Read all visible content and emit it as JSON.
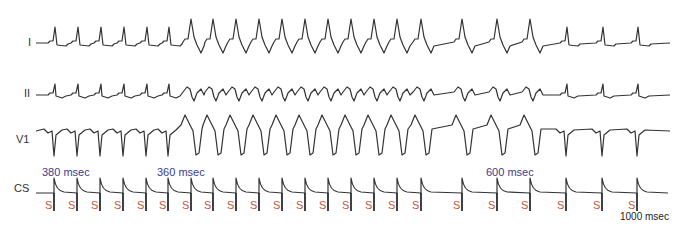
{
  "figure": {
    "leads": [
      {
        "id": "I",
        "label": "I",
        "baseline_y": 43
      },
      {
        "id": "II",
        "label": "II",
        "baseline_y": 95
      },
      {
        "id": "V1",
        "label": "V1",
        "baseline_y": 133
      },
      {
        "id": "CS",
        "label": "CS",
        "baseline_y": 195
      }
    ],
    "interval_labels": [
      {
        "text": "380 msec",
        "x": 42,
        "y": 167
      },
      {
        "text": "360 msec",
        "x": 158,
        "y": 167
      },
      {
        "text": "600 msec",
        "x": 486,
        "y": 167
      }
    ],
    "footnote": {
      "text": "1000 msec",
      "x": 622,
      "y": 212
    },
    "stim_marker": {
      "label": "S",
      "color": "#c8553a"
    },
    "stim_x": [
      54,
      77,
      100,
      123,
      146,
      168,
      191,
      213,
      236,
      259,
      282,
      305,
      328,
      351,
      374,
      397,
      421,
      462,
      497,
      530,
      566,
      602,
      637
    ],
    "s_label_x": [
      45,
      68,
      91,
      114,
      137,
      159,
      182,
      204,
      227,
      250,
      273,
      296,
      319,
      342,
      365,
      388,
      412,
      453,
      488,
      521,
      557,
      593,
      628
    ],
    "colors": {
      "trace": "#333333",
      "interval_text": "#3b3b8a",
      "stim_text": "#c8553a"
    }
  }
}
